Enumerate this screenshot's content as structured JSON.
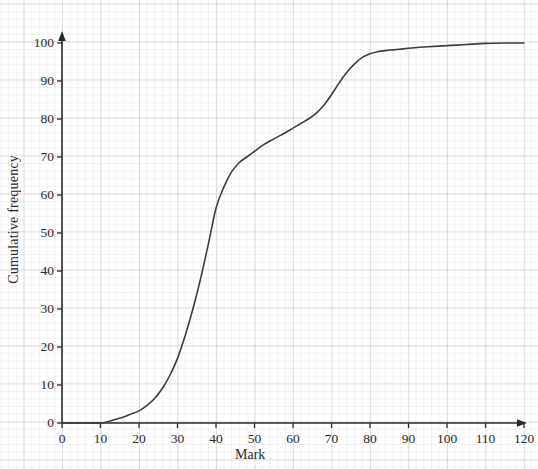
{
  "chart_data": {
    "type": "line",
    "title": "",
    "subtitle": "",
    "xlabel": "Mark",
    "ylabel": "Cumulative frequency",
    "xlim": [
      0,
      120
    ],
    "ylim": [
      0,
      100
    ],
    "x_ticks": [
      0,
      10,
      20,
      30,
      40,
      50,
      60,
      70,
      80,
      90,
      100,
      110,
      120
    ],
    "y_ticks": [
      0,
      10,
      20,
      30,
      40,
      50,
      60,
      70,
      80,
      90,
      100
    ],
    "x_tick_labels": [
      "0",
      "10",
      "20",
      "30",
      "40",
      "50",
      "60",
      "70",
      "80",
      "90",
      "100",
      "110",
      "120"
    ],
    "y_tick_labels": [
      "0",
      "10",
      "20",
      "30",
      "40",
      "50",
      "60",
      "70",
      "80",
      "90",
      "100"
    ],
    "x_minor_step": 2,
    "y_minor_step": 2,
    "grid": true,
    "grid_style": "graph-paper",
    "legend": false,
    "legend_position": "none",
    "axis_arrows": true,
    "series": [
      {
        "name": "Cumulative frequency",
        "color": "#3c3c42",
        "line_width": 1.6,
        "x": [
          0,
          5,
          10,
          12,
          14,
          16,
          18,
          20,
          22,
          24,
          26,
          28,
          30,
          32,
          34,
          36,
          38,
          40,
          42,
          44,
          46,
          48,
          50,
          52,
          54,
          56,
          58,
          60,
          62,
          64,
          66,
          68,
          70,
          72,
          74,
          76,
          78,
          80,
          82,
          84,
          86,
          88,
          90,
          95,
          100,
          105,
          110,
          115,
          120
        ],
        "y": [
          0,
          0,
          0,
          0.4,
          1,
          1.6,
          2.4,
          3.2,
          4.6,
          6.4,
          9,
          12.5,
          17,
          23,
          30,
          38,
          47,
          56.5,
          62,
          66,
          68.5,
          70,
          71.5,
          73,
          74.2,
          75.3,
          76.4,
          77.6,
          78.8,
          80,
          81.5,
          83.6,
          86.4,
          89.5,
          92.3,
          94.5,
          96.2,
          97.2,
          97.7,
          98,
          98.2,
          98.4,
          98.6,
          99,
          99.3,
          99.6,
          99.9,
          100,
          100
        ]
      }
    ],
    "annotations": [],
    "background_color": "#ffffff",
    "major_grid_color": "#aaa0af",
    "minor_grid_color": "#b9afbe",
    "axis_color": "#2a2a2a"
  },
  "axes": {
    "y_title": "Cumulative frequency",
    "x_title": "Mark"
  }
}
